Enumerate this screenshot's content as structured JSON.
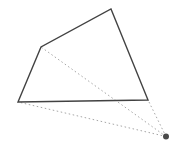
{
  "diagram": {
    "type": "geometry-figure",
    "background_color": "#ffffff",
    "polygon": {
      "stroke_color": "#424242",
      "stroke_width": 1.4,
      "fill": "none",
      "vertices": [
        {
          "x": 111,
          "y": 9
        },
        {
          "x": 148,
          "y": 100
        },
        {
          "x": 18,
          "y": 102
        },
        {
          "x": 41,
          "y": 47
        }
      ]
    },
    "external_point": {
      "x": 166,
      "y": 136.5,
      "radius": 3,
      "color": "#4a4a4a"
    },
    "dotted_lines": {
      "stroke_color": "#a6a6a6",
      "stroke_width": 1,
      "dash_pattern": "1.5 2.6",
      "targets": [
        {
          "x": 41,
          "y": 47
        },
        {
          "x": 18,
          "y": 102
        },
        {
          "x": 148,
          "y": 100
        }
      ]
    }
  }
}
